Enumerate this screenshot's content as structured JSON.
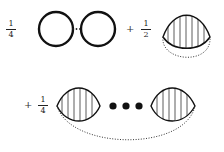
{
  "diagram": {
    "terms": [
      {
        "operator": "",
        "coefficient": {
          "numerator": "1",
          "denominator": "4"
        },
        "shape": "chain of two solid circles joined by dotted ellipsis"
      },
      {
        "operator": "+",
        "coefficient": {
          "numerator": "1",
          "denominator": "2"
        },
        "shape": "hatched lens with dotted lower arc"
      },
      {
        "operator": "+",
        "coefficient": {
          "numerator": "1",
          "denominator": "4"
        },
        "shape": "two hatched lenses joined by three dots, with a dotted arc below"
      }
    ],
    "ellipsis_small": "···",
    "colors": {
      "stroke": "#111111",
      "hatch": "#333333",
      "background": "#ffffff"
    }
  }
}
